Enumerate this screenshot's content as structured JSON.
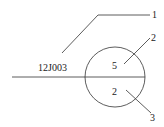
{
  "diagram": {
    "reference_code": "12J003",
    "circle_upper_value": "5",
    "circle_lower_value": "2",
    "callouts": [
      {
        "number": "1"
      },
      {
        "number": "2"
      },
      {
        "number": "3"
      }
    ],
    "stroke_color": "#333333"
  }
}
